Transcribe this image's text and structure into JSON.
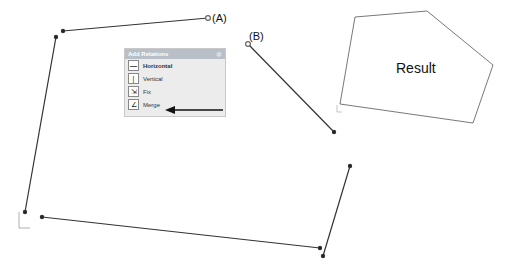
{
  "labels": {
    "a": "(A)",
    "b": "(B)",
    "result": "Result"
  },
  "panel": {
    "title": "Add Relations",
    "pin_icon": "pin-icon",
    "items": [
      {
        "label": "Horizontal",
        "icon": "horizontal-icon",
        "glyph": "—",
        "bold": true
      },
      {
        "label": "Vertical",
        "icon": "vertical-icon",
        "glyph": "|",
        "bold": false
      },
      {
        "label": "Fix",
        "icon": "fix-icon",
        "glyph": "⇲",
        "bold": false
      },
      {
        "label": "Merge",
        "icon": "merge-icon",
        "glyph": "∠",
        "bold": false
      }
    ]
  },
  "colors": {
    "line": "#333333",
    "polygon": "#555555",
    "panel_header": "#b9bfc7"
  }
}
